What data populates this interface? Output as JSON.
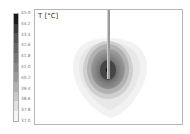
{
  "chart_data": {
    "type": "heatmap",
    "title": "T [°C]",
    "quantity": "Temperature",
    "unit": "°C",
    "colormap": "grayscale (white = low, black = high)",
    "colorbar": {
      "min": 37.0,
      "max": 45.0,
      "ticks": [
        "45.0",
        "44.2",
        "43.4",
        "42.6",
        "41.8",
        "41.0",
        "40.2",
        "39.4",
        "38.6",
        "37.8",
        "37.0"
      ],
      "colors": [
        "#1a1a1a",
        "#3a3a3a",
        "#555555",
        "#666666",
        "#777777",
        "#888888",
        "#9a9a9a",
        "#b0b0b0",
        "#c8c8c8",
        "#e0e0e0",
        "#f5f5f5"
      ]
    },
    "field": {
      "description": "Concentric temperature contours around a probe tip; hot spot (~45 °C) at probe tip, decaying outward to ~37 °C; outer isotherm is inverted-teardrop shaped",
      "hotspot": {
        "x_px": 107,
        "y_px": 69
      },
      "probe": {
        "x_px": 107,
        "from_y_px": 0,
        "to_y_px": 69
      }
    },
    "grid": false,
    "legend_position": "left"
  }
}
